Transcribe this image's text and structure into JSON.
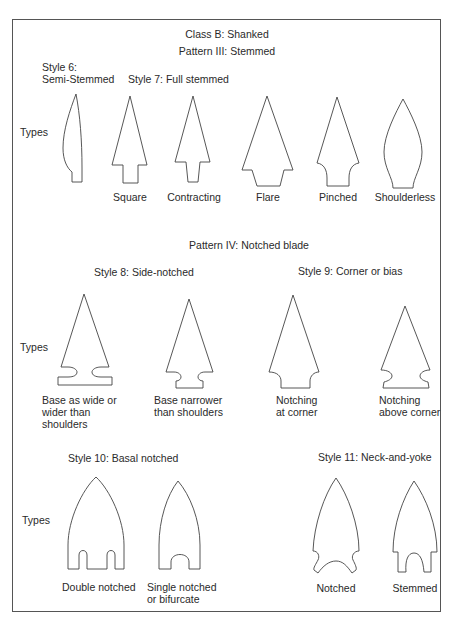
{
  "diagram": {
    "class_title": "Class B: Shanked",
    "pattern3": {
      "title": "Pattern III: Stemmed",
      "style6": {
        "label_line1": "Style 6:",
        "label_line2": "Semi-Stemmed"
      },
      "style7": {
        "label": "Style 7: Full stemmed"
      },
      "types_label": "Types",
      "types": [
        {
          "name": "Square"
        },
        {
          "name": "Contracting"
        },
        {
          "name": "Flare"
        },
        {
          "name": "Pinched"
        },
        {
          "name": "Shoulderless"
        }
      ]
    },
    "pattern4": {
      "title": "Pattern IV: Notched blade",
      "style8": {
        "label": "Style 8: Side-notched",
        "types": [
          {
            "line1": "Base as wide or",
            "line2": "wider than",
            "line3": "shoulders"
          },
          {
            "line1": "Base narrower",
            "line2": "than shoulders"
          }
        ]
      },
      "style9": {
        "label": "Style 9: Corner or bias",
        "types": [
          {
            "line1": "Notching",
            "line2": "at corner"
          },
          {
            "line1": "Notching",
            "line2": "above corner"
          }
        ]
      },
      "types_label": "Types"
    },
    "style10": {
      "label": "Style 10: Basal notched",
      "types_label": "Types",
      "types": [
        {
          "line1": "Double notched"
        },
        {
          "line1": "Single notched",
          "line2": "or bifurcate"
        }
      ]
    },
    "style11": {
      "label": "Style 11: Neck-and-yoke",
      "types": [
        {
          "line1": "Notched"
        },
        {
          "line1": "Stemmed"
        }
      ]
    }
  }
}
